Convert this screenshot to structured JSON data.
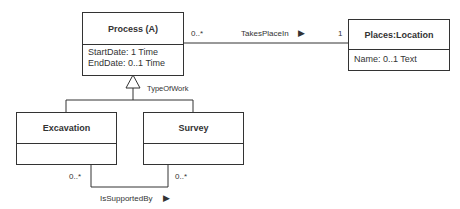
{
  "classes": {
    "process": {
      "name": "Process (A)",
      "attributes": [
        "StartDate: 1 Time",
        "EndDate: 0..1 Time"
      ]
    },
    "places": {
      "name": "Places:Location",
      "attributes": [
        "Name: 0..1 Text"
      ]
    },
    "excavation": {
      "name": "Excavation",
      "attributes": []
    },
    "survey": {
      "name": "Survey",
      "attributes": []
    }
  },
  "associations": {
    "takes_place_in": {
      "label": "TakesPlaceIn",
      "direction_glyph": "▶",
      "source_multiplicity": "0..*",
      "target_multiplicity": "1"
    },
    "type_of_work": {
      "label": "TypeOfWork"
    },
    "is_supported_by": {
      "label": "IsSupportedBy",
      "direction_glyph": "▶",
      "left_multiplicity": "0..*",
      "right_multiplicity": "0..*"
    }
  }
}
